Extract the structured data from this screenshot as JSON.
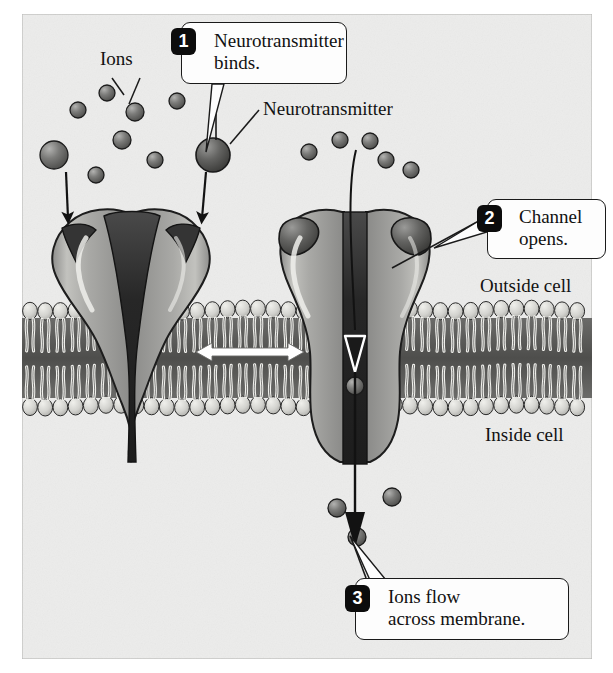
{
  "figure": {
    "background_color": "#ececeb",
    "border_color": "#b9b9b7"
  },
  "labels": {
    "ions": "Ions",
    "neurotransmitter": "Neurotransmitter",
    "outside_cell": "Outside cell",
    "inside_cell": "Inside cell"
  },
  "callouts": [
    {
      "number": "1",
      "text": "Neurotransmitter\nbinds."
    },
    {
      "number": "2",
      "text": "Channel\nopens."
    },
    {
      "number": "3",
      "text": "Ions flow\nacross membrane."
    }
  ],
  "colors": {
    "protein_light": "#a8a8a6",
    "protein_mid": "#8f8f8d",
    "protein_dark": "#3b3b3b",
    "pore_dark": "#262626",
    "ion": "#6f6f6f",
    "neurotransmitter": "#5a5a5a",
    "membrane_head": "#d6d6d2",
    "membrane_core": "#555553",
    "outline": "#1a1a1a",
    "callout_fill": "#fdfdfd",
    "badge_fill": "#0c0c0c",
    "badge_text": "#ffffff",
    "white_arrow": "#ffffff"
  },
  "diagram": {
    "membrane": {
      "top_y": 300,
      "bottom_y": 416,
      "left_x": 22,
      "right_x": 592
    },
    "channel_closed": {
      "state": "closed",
      "center_x": 130,
      "binding_sites_occupied": 0,
      "pore_open": false
    },
    "channel_open": {
      "state": "open",
      "center_x": 355,
      "binding_sites_occupied": 2,
      "pore_open": true,
      "ion_in_pore": true
    },
    "ions_above_closed": [
      {
        "x": 78,
        "y": 110,
        "r": 8
      },
      {
        "x": 107,
        "y": 93,
        "r": 8
      },
      {
        "x": 135,
        "y": 112,
        "r": 9
      },
      {
        "x": 122,
        "y": 140,
        "r": 9
      },
      {
        "x": 155,
        "y": 160,
        "r": 8
      },
      {
        "x": 96,
        "y": 175,
        "r": 8
      },
      {
        "x": 177,
        "y": 101,
        "r": 8
      },
      {
        "x": 54,
        "y": 155,
        "r": 14
      }
    ],
    "ions_above_open": [
      {
        "x": 309,
        "y": 152,
        "r": 8
      },
      {
        "x": 340,
        "y": 140,
        "r": 8
      },
      {
        "x": 370,
        "y": 141,
        "r": 8
      },
      {
        "x": 386,
        "y": 160,
        "r": 8
      },
      {
        "x": 411,
        "y": 170,
        "r": 8
      }
    ],
    "ions_below_membrane": [
      {
        "x": 337,
        "y": 508,
        "r": 9
      },
      {
        "x": 392,
        "y": 497,
        "r": 9
      },
      {
        "x": 357,
        "y": 537,
        "r": 9
      }
    ],
    "neurotransmitters_free": [
      {
        "x": 213,
        "y": 155,
        "r": 17
      }
    ],
    "arrows": {
      "ions_into_closed_left": {
        "from": [
          68,
          170
        ],
        "to": [
          69,
          222
        ]
      },
      "ions_into_closed_right": {
        "from": [
          205,
          170
        ],
        "to": [
          201,
          222
        ]
      },
      "flow_through_pore": {
        "from": [
          355,
          150
        ],
        "to": [
          355,
          545
        ]
      },
      "lateral_double_arrow": {
        "from": [
          200,
          352
        ],
        "to": [
          300,
          352
        ],
        "color": "#ffffff"
      }
    }
  }
}
